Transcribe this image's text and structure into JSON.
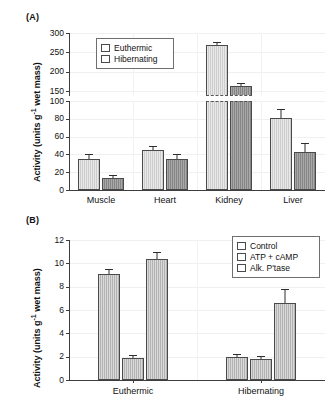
{
  "figure": {
    "panels": [
      {
        "label": "(A)"
      },
      {
        "label": "(B)"
      }
    ]
  },
  "panel_a": {
    "label": "(A)",
    "ylabel_main": "Activity (units g",
    "ylabel_sup": "-1",
    "ylabel_tail": " wet mass)",
    "legend": {
      "items": [
        {
          "label": "Euthermic",
          "color": "#cdcdcd"
        },
        {
          "label": "Hibernating",
          "color": "#868686"
        }
      ]
    },
    "lower_ticks": [
      "0",
      "20",
      "40",
      "60",
      "80",
      "100"
    ],
    "upper_ticks": [
      "150",
      "200",
      "250",
      "300"
    ],
    "categories": [
      "Muscle",
      "Heart",
      "Kidney",
      "Liver"
    ]
  },
  "panel_b": {
    "label": "(B)",
    "ylabel_main": "Activity (units g",
    "ylabel_sup": "-1",
    "ylabel_tail": " wet mass)",
    "legend": {
      "items": [
        {
          "label": "Control",
          "color": "#b3b3b3"
        },
        {
          "label": "ATP + cAMP",
          "color": "#b3b3b3"
        },
        {
          "label": "Alk. P'tase",
          "color": "#b3b3b3"
        }
      ]
    },
    "ticks": [
      "0",
      "2",
      "4",
      "6",
      "8",
      "10",
      "12"
    ],
    "categories": [
      "Euthermic",
      "Hibernating"
    ]
  },
  "chart_data": [
    {
      "type": "bar",
      "panel": "A",
      "title": "",
      "xlabel": "",
      "ylabel": "Activity (units g-1 wet mass)",
      "categories": [
        "Muscle",
        "Heart",
        "Kidney",
        "Liver"
      ],
      "ylim_lower": [
        0,
        100
      ],
      "ylim_upper": [
        140,
        300
      ],
      "yticks_lower": [
        0,
        20,
        40,
        60,
        80,
        100
      ],
      "yticks_upper": [
        150,
        200,
        250,
        300
      ],
      "axis_break": true,
      "grid": true,
      "legend_position": "top-left-inside",
      "series": [
        {
          "name": "Euthermic",
          "color": "#cdcdcd",
          "values": [
            35,
            45,
            270,
            81
          ],
          "errors": [
            6,
            5,
            7,
            10
          ]
        },
        {
          "name": "Hibernating",
          "color": "#868686",
          "values": [
            14,
            35,
            162,
            43
          ],
          "errors": [
            3,
            5,
            10,
            10
          ]
        }
      ]
    },
    {
      "type": "bar",
      "panel": "B",
      "title": "",
      "xlabel": "",
      "ylabel": "Activity (units g-1 wet mass)",
      "categories": [
        "Euthermic",
        "Hibernating"
      ],
      "ylim": [
        0,
        12
      ],
      "yticks": [
        0,
        2,
        4,
        6,
        8,
        10,
        12
      ],
      "grid": true,
      "legend_position": "top-right-inside",
      "series": [
        {
          "name": "Control",
          "color": "#b3b3b3",
          "values": [
            9.05,
            2.0
          ],
          "errors": [
            0.45,
            0.2
          ]
        },
        {
          "name": "ATP + cAMP",
          "color": "#b3b3b3",
          "values": [
            1.85,
            1.8
          ],
          "errors": [
            0.3,
            0.3
          ]
        },
        {
          "name": "Alk. P'tase",
          "color": "#b3b3b3",
          "values": [
            10.4,
            6.6
          ],
          "errors": [
            0.6,
            1.2
          ]
        }
      ]
    }
  ]
}
